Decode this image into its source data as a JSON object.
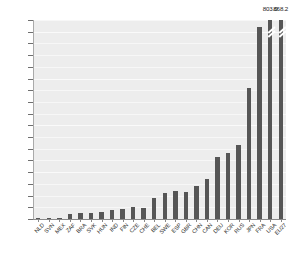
{
  "chart_data": {
    "type": "bar",
    "title": "",
    "subtitle": "",
    "xlabel": "",
    "ylabel": "",
    "categories": [
      "NLD",
      "SVN",
      "MEX",
      "ZAF",
      "BRA",
      "SVK",
      "HUN",
      "IND",
      "FIN",
      "CZE",
      "CHE",
      "BEL",
      "SWE",
      "ESP",
      "GBR",
      "CHN",
      "CAN",
      "DEU",
      "KOR",
      "RUS",
      "JPN",
      "FRA",
      "USA",
      "EU27"
    ],
    "values": [
      2,
      2,
      3,
      11,
      12,
      12,
      14,
      19,
      21,
      25,
      24,
      45,
      55,
      59,
      57,
      71,
      85,
      132,
      141,
      159,
      280,
      409,
      803.0,
      868.2
    ],
    "ylim": [
      0,
      425
    ],
    "ytick_labels": [
      "0",
      "25",
      "50",
      "75",
      "100",
      "125",
      "150",
      "175",
      "200",
      "225",
      "250",
      "275",
      "300",
      "325",
      "350",
      "375",
      "400",
      "425"
    ],
    "ytick_values": [
      0,
      25,
      50,
      75,
      100,
      125,
      150,
      175,
      200,
      225,
      250,
      275,
      300,
      325,
      350,
      375,
      400,
      425
    ],
    "grid": true,
    "legend": "none",
    "bar_color": "#565656",
    "plot_background": "#ededed",
    "annotations": [
      {
        "category": "USA",
        "label": "803.0",
        "broken_axis": true
      },
      {
        "category": "EU27",
        "label": "868.2",
        "broken_axis": true
      }
    ]
  }
}
